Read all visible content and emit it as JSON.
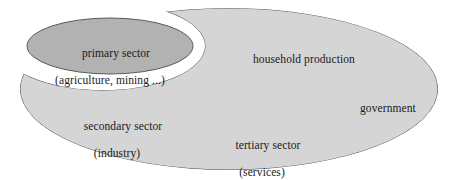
{
  "diagram": {
    "type": "venn-crescent-diagram",
    "colors": {
      "background": "#ffffff",
      "outer_shape_fill": "#d5d5d5",
      "inner_ellipse_fill": "#b2b2b2",
      "outline": "#5a5a5a",
      "text": "#1a1a1a"
    },
    "shapes": [
      {
        "name": "outer-economy-shape",
        "role": "large light gray ellipse with crescent notch cut from upper-left",
        "fill": "#d5d5d5",
        "bounds": {
          "x": 20,
          "y": 8,
          "width": 418,
          "height": 162
        }
      },
      {
        "name": "primary-sector-ellipse",
        "role": "darker gray ellipse nested in the notch",
        "fill": "#b2b2b2",
        "bounds": {
          "x": 27,
          "y": 18,
          "width": 166,
          "height": 56
        }
      }
    ],
    "labels": [
      {
        "name": "primary-sector",
        "line1": "primary sector",
        "line2": "(agriculture, mining ...)"
      },
      {
        "name": "household-production",
        "line1": "household production",
        "line2": ""
      },
      {
        "name": "government",
        "line1": "government",
        "line2": ""
      },
      {
        "name": "secondary-sector",
        "line1": "secondary sector",
        "line2": "(industry)"
      },
      {
        "name": "tertiary-sector",
        "line1": "tertiary sector",
        "line2": "(services)"
      }
    ]
  }
}
